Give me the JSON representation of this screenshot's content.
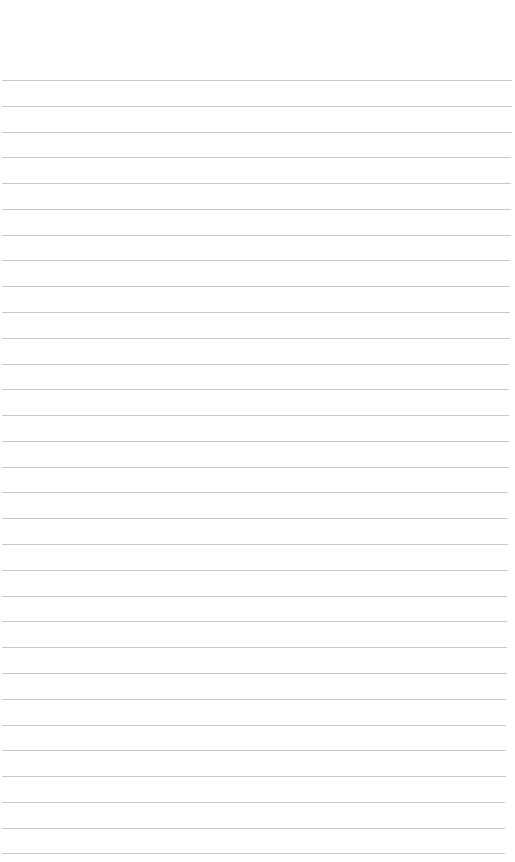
{
  "paper": {
    "background": "#ffffff",
    "line_color": "#c8c8c8",
    "first_line_y": 80,
    "line_spacing": 25.78,
    "line_count": 31,
    "line_left": 2,
    "line_right_top": 512,
    "line_right_bottom": 505
  }
}
